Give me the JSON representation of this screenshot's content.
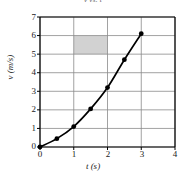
{
  "chart_data": {
    "type": "line",
    "title": "v vs. t",
    "xlabel": "t (s)",
    "ylabel": "v (m/s)",
    "xlim": [
      0,
      4
    ],
    "ylim": [
      0,
      7
    ],
    "xticks": [
      "0",
      "1",
      "2",
      "3",
      "4"
    ],
    "yticks": [
      "0",
      "1",
      "2",
      "3",
      "4",
      "5",
      "6",
      "7"
    ],
    "grid": true,
    "legend": null,
    "series": [
      {
        "name": "v(t)",
        "marker": "filled-circle",
        "color": "#000000",
        "x": [
          0,
          0.5,
          1.0,
          1.5,
          2.0,
          2.5,
          3.0
        ],
        "values": [
          0,
          0.45,
          1.1,
          2.05,
          3.2,
          4.7,
          6.1
        ]
      }
    ],
    "annotations": [
      {
        "type": "shaded-rect",
        "name": "area-under-curve-cell",
        "x0": 1,
        "x1": 2,
        "y0": 5,
        "y1": 6,
        "color": "#d2d2d2"
      }
    ]
  },
  "axis": {
    "y_tick_labels": [
      "7",
      "6",
      "5",
      "4",
      "3",
      "2",
      "1",
      "0"
    ],
    "x_tick_labels": [
      "0",
      "1",
      "2",
      "3",
      "4"
    ]
  }
}
